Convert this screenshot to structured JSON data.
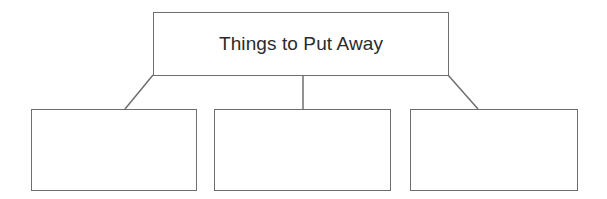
{
  "diagram": {
    "type": "tree",
    "root": {
      "label": "Things to Put Away",
      "x": 153,
      "y": 12,
      "w": 296,
      "h": 64
    },
    "children": [
      {
        "label": "",
        "x": 31,
        "y": 109,
        "w": 166,
        "h": 82
      },
      {
        "label": "",
        "x": 214,
        "y": 109,
        "w": 177,
        "h": 82
      },
      {
        "label": "",
        "x": 410,
        "y": 109,
        "w": 168,
        "h": 82
      }
    ],
    "connectors": [
      {
        "from": [
          153,
          75
        ],
        "to": [
          125,
          109
        ]
      },
      {
        "from": [
          303,
          75
        ],
        "to": [
          303,
          109
        ]
      },
      {
        "from": [
          448,
          75
        ],
        "to": [
          478,
          109
        ]
      }
    ],
    "colors": {
      "stroke": "#6e6e6e",
      "text": "#2b2b2b",
      "background": "#ffffff"
    }
  }
}
